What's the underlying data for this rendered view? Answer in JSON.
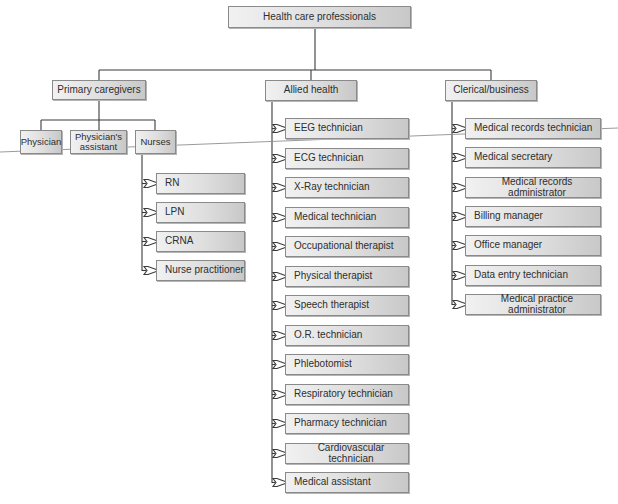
{
  "diagram": {
    "type": "org-chart",
    "root": {
      "label": "Health care professionals"
    },
    "categories": [
      {
        "label": "Primary caregivers",
        "children": [
          {
            "label": "Physician"
          },
          {
            "label": "Physician's assistant"
          },
          {
            "label": "Nurses",
            "children": [
              {
                "label": "RN"
              },
              {
                "label": "LPN"
              },
              {
                "label": "CRNA"
              },
              {
                "label": "Nurse practitioner"
              }
            ]
          }
        ]
      },
      {
        "label": "Allied health",
        "children": [
          {
            "label": "EEG technician"
          },
          {
            "label": "ECG technician"
          },
          {
            "label": "X-Ray technician"
          },
          {
            "label": "Medical technician"
          },
          {
            "label": "Occupational therapist"
          },
          {
            "label": "Physical therapist"
          },
          {
            "label": "Speech therapist"
          },
          {
            "label": "O.R. technician"
          },
          {
            "label": "Phlebotomist"
          },
          {
            "label": "Respiratory technician"
          },
          {
            "label": "Pharmacy technician"
          },
          {
            "label": "Cardiovascular technician"
          },
          {
            "label": "Medical assistant"
          }
        ]
      },
      {
        "label": "Clerical/business",
        "children": [
          {
            "label": "Medical records technician"
          },
          {
            "label": "Medical secretary"
          },
          {
            "label": "Medical records administrator"
          },
          {
            "label": "Billing manager"
          },
          {
            "label": "Office manager"
          },
          {
            "label": "Data entry technician"
          },
          {
            "label": "Medical practice administrator"
          }
        ]
      }
    ]
  },
  "colors": {
    "box_border": "#8a8a8a",
    "box_fill_light": "#f1f1f1",
    "box_fill_dark": "#c8c8c8",
    "connector": "#3a3a3a",
    "arrow_fill": "#ffffff",
    "stray_line": "#909090"
  }
}
